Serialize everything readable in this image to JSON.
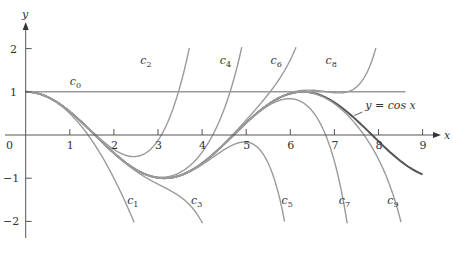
{
  "chart_data": {
    "type": "line",
    "title": "",
    "xlabel": "x",
    "ylabel": "y",
    "xlim": [
      0,
      9
    ],
    "ylim": [
      -2,
      2
    ],
    "grid": false,
    "x_ticks": [
      "0",
      "1",
      "2",
      "3",
      "4",
      "5",
      "6",
      "7",
      "8",
      "9"
    ],
    "y_ticks": [
      "2",
      "1",
      "-1",
      "-2"
    ],
    "series": [
      {
        "name": "y = cos x",
        "kind": "cos",
        "label": "y = cos x",
        "color": "#555555"
      },
      {
        "name": "c0",
        "degree": 0,
        "label": "c",
        "sub": "0",
        "color": "#999999"
      },
      {
        "name": "c1",
        "degree": 2,
        "label": "c",
        "sub": "1",
        "color": "#999999"
      },
      {
        "name": "c2",
        "degree": 4,
        "label": "c",
        "sub": "2",
        "color": "#999999"
      },
      {
        "name": "c3",
        "degree": 6,
        "label": "c",
        "sub": "3",
        "color": "#999999"
      },
      {
        "name": "c4",
        "degree": 8,
        "label": "c",
        "sub": "4",
        "color": "#999999"
      },
      {
        "name": "c5",
        "degree": 10,
        "label": "c",
        "sub": "5",
        "color": "#999999"
      },
      {
        "name": "c6",
        "degree": 12,
        "label": "c",
        "sub": "6",
        "color": "#999999"
      },
      {
        "name": "c7",
        "degree": 14,
        "label": "c",
        "sub": "7",
        "color": "#999999"
      },
      {
        "name": "c8",
        "degree": 16,
        "label": "c",
        "sub": "8",
        "color": "#999999"
      },
      {
        "name": "c9",
        "degree": 18,
        "label": "c",
        "sub": "9",
        "color": "#999999"
      }
    ],
    "annotations": [
      {
        "text": "c0",
        "x": 1.0,
        "y": 1.15
      },
      {
        "text": "c1",
        "x": 2.3,
        "y": -1.6
      },
      {
        "text": "c2",
        "x": 2.6,
        "y": 1.65
      },
      {
        "text": "c3",
        "x": 3.75,
        "y": -1.6
      },
      {
        "text": "c4",
        "x": 4.4,
        "y": 1.65
      },
      {
        "text": "c5",
        "x": 5.8,
        "y": -1.6
      },
      {
        "text": "c6",
        "x": 5.55,
        "y": 1.65
      },
      {
        "text": "c7",
        "x": 7.1,
        "y": -1.6
      },
      {
        "text": "c8",
        "x": 6.8,
        "y": 1.65
      },
      {
        "text": "c9",
        "x": 8.2,
        "y": -1.6
      },
      {
        "text": "y = cos x",
        "x": 7.7,
        "y": 0.6
      }
    ]
  },
  "labels": {
    "x_axis": "x",
    "y_axis": "y",
    "cos_label": "y = cos x"
  }
}
